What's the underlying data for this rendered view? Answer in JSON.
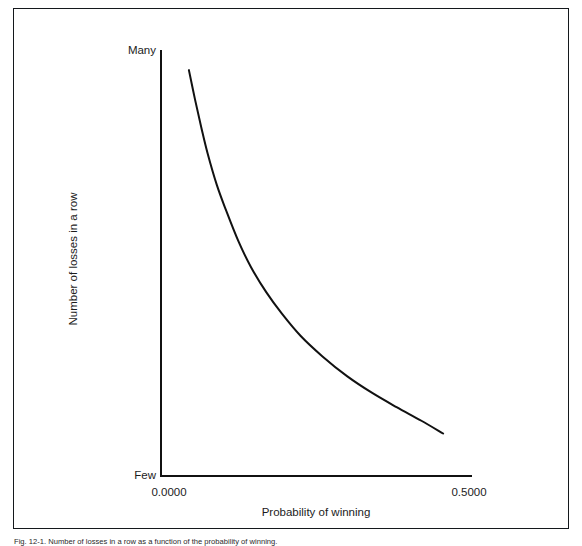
{
  "figure": {
    "caption": "Fig. 12-1. Number of losses in a row as a function of the probability of winning."
  },
  "axes": {
    "y_title": "Number of losses in a row",
    "y_tick_top": "Many",
    "y_tick_bottom": "Few",
    "x_title": "Probability of winning",
    "x_tick_left": "0.0000",
    "x_tick_right": "0.5000"
  },
  "style": {
    "line_color": "#111111",
    "axis_color": "#111111",
    "frame_color": "#14181c",
    "background": "#ffffff"
  },
  "chart_data": {
    "type": "line",
    "title": "",
    "subtitle": "",
    "xlabel": "Probability of winning",
    "ylabel": "Number of losses in a row",
    "xlim": [
      0.0,
      0.5
    ],
    "ylim": [
      0,
      1
    ],
    "xticks": [
      0.0,
      0.5
    ],
    "xticklabels": [
      "0.0000",
      "0.5000"
    ],
    "yticks": [
      0,
      1
    ],
    "yticklabels": [
      "Few",
      "Many"
    ],
    "grid": false,
    "legend": false,
    "annotations": [],
    "series": [
      {
        "name": "Losses in a row",
        "x": [
          0.045,
          0.055,
          0.065,
          0.075,
          0.09,
          0.105,
          0.125,
          0.145,
          0.17,
          0.195,
          0.225,
          0.26,
          0.3,
          0.34,
          0.38,
          0.42,
          0.455
        ],
        "y": [
          0.955,
          0.885,
          0.82,
          0.76,
          0.685,
          0.625,
          0.552,
          0.492,
          0.432,
          0.382,
          0.33,
          0.282,
          0.235,
          0.196,
          0.162,
          0.13,
          0.1
        ]
      }
    ]
  }
}
